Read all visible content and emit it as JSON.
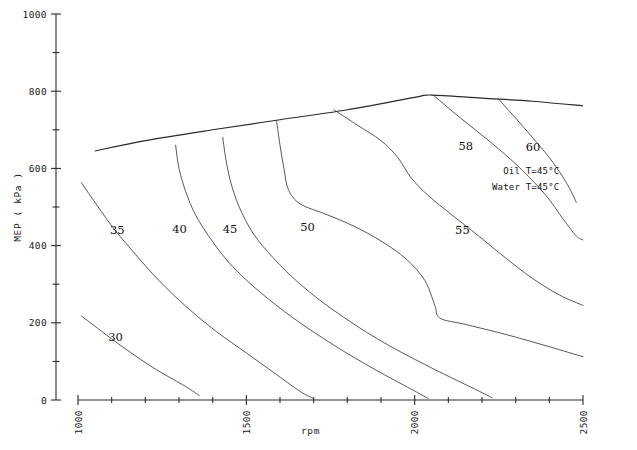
{
  "chart_data": {
    "type": "line",
    "title": "",
    "subtitle": "",
    "xlabel": "rpm",
    "ylabel": "MEP ( kPa )",
    "xlim": [
      1000,
      2500
    ],
    "ylim": [
      0,
      1000
    ],
    "grid": false,
    "legend_position": "none",
    "x_ticks": [
      "1000",
      "1500",
      "2000",
      "2500"
    ],
    "x_tick_values": [
      1000,
      1500,
      2000,
      2500
    ],
    "x_minor_step": 100,
    "y_ticks": [
      "0",
      "200",
      "400",
      "600",
      "800",
      "1000"
    ],
    "y_tick_values": [
      0,
      200,
      400,
      600,
      800,
      1000
    ],
    "y_minor_step": 100,
    "annotations": [
      {
        "name": "oil-temperature",
        "text": "Oil T=45°C",
        "x": 2430,
        "y": 585
      },
      {
        "name": "water-temperature",
        "text": "Water T=45°C",
        "x": 2430,
        "y": 545
      }
    ],
    "envelope": {
      "name": "full-load-envelope",
      "label": "",
      "points": [
        [
          1050,
          645
        ],
        [
          1200,
          672
        ],
        [
          1400,
          700
        ],
        [
          1600,
          726
        ],
        [
          1800,
          752
        ],
        [
          2000,
          784
        ],
        [
          2050,
          790
        ],
        [
          2200,
          782
        ],
        [
          2350,
          774
        ],
        [
          2500,
          762
        ]
      ]
    },
    "series": [
      {
        "name": "bsfc-30",
        "label": "30",
        "label_x": 1090,
        "label_y": 152,
        "points": [
          [
            1010,
            218
          ],
          [
            1070,
            178
          ],
          [
            1140,
            133
          ],
          [
            1230,
            80
          ],
          [
            1310,
            40
          ],
          [
            1360,
            12
          ]
        ]
      },
      {
        "name": "bsfc-35",
        "label": "35",
        "label_x": 1095,
        "label_y": 430,
        "points": [
          [
            1010,
            563
          ],
          [
            1060,
            500
          ],
          [
            1110,
            440
          ],
          [
            1170,
            378
          ],
          [
            1240,
            310
          ],
          [
            1320,
            243
          ],
          [
            1410,
            178
          ],
          [
            1500,
            122
          ],
          [
            1580,
            72
          ],
          [
            1660,
            22
          ],
          [
            1700,
            4
          ]
        ]
      },
      {
        "name": "bsfc-40",
        "label": "40",
        "label_x": 1280,
        "label_y": 432,
        "points": [
          [
            1290,
            660
          ],
          [
            1300,
            600
          ],
          [
            1320,
            540
          ],
          [
            1350,
            478
          ],
          [
            1400,
            410
          ],
          [
            1460,
            345
          ],
          [
            1540,
            280
          ],
          [
            1640,
            212
          ],
          [
            1760,
            142
          ],
          [
            1880,
            80
          ],
          [
            1990,
            28
          ],
          [
            2040,
            4
          ]
        ]
      },
      {
        "name": "bsfc-45",
        "label": "45",
        "label_x": 1430,
        "label_y": 432,
        "points": [
          [
            1430,
            680
          ],
          [
            1440,
            620
          ],
          [
            1455,
            560
          ],
          [
            1480,
            498
          ],
          [
            1520,
            432
          ],
          [
            1580,
            368
          ],
          [
            1660,
            300
          ],
          [
            1760,
            232
          ],
          [
            1890,
            158
          ],
          [
            2030,
            92
          ],
          [
            2170,
            32
          ],
          [
            2230,
            6
          ]
        ]
      },
      {
        "name": "bsfc-50",
        "label": "50",
        "label_x": 1660,
        "label_y": 437,
        "points": [
          [
            1590,
            722
          ],
          [
            1600,
            660
          ],
          [
            1612,
            598
          ],
          [
            1625,
            545
          ],
          [
            1660,
            508
          ],
          [
            1740,
            480
          ],
          [
            1820,
            450
          ],
          [
            1900,
            412
          ],
          [
            1975,
            365
          ],
          [
            2030,
            310
          ],
          [
            2060,
            245
          ],
          [
            2075,
            212
          ],
          [
            2150,
            196
          ],
          [
            2270,
            170
          ],
          [
            2400,
            138
          ],
          [
            2500,
            112
          ]
        ]
      },
      {
        "name": "bsfc-55",
        "label": "55",
        "label_x": 2120,
        "label_y": 430,
        "points": [
          [
            1760,
            752
          ],
          [
            1830,
            712
          ],
          [
            1900,
            672
          ],
          [
            1950,
            628
          ],
          [
            1990,
            575
          ],
          [
            2040,
            530
          ],
          [
            2110,
            480
          ],
          [
            2190,
            425
          ],
          [
            2270,
            368
          ],
          [
            2350,
            315
          ],
          [
            2430,
            272
          ],
          [
            2500,
            245
          ]
        ]
      },
      {
        "name": "bsfc-58",
        "label": "58",
        "label_x": 2130,
        "label_y": 648,
        "points": [
          [
            2055,
            790
          ],
          [
            2120,
            742
          ],
          [
            2180,
            700
          ],
          [
            2250,
            650
          ],
          [
            2320,
            595
          ],
          [
            2390,
            530
          ],
          [
            2440,
            470
          ],
          [
            2480,
            425
          ],
          [
            2500,
            415
          ]
        ]
      },
      {
        "name": "bsfc-60",
        "label": "60",
        "label_x": 2330,
        "label_y": 645,
        "points": [
          [
            2250,
            779
          ],
          [
            2300,
            730
          ],
          [
            2350,
            680
          ],
          [
            2400,
            628
          ],
          [
            2440,
            578
          ],
          [
            2465,
            540
          ],
          [
            2480,
            512
          ]
        ]
      }
    ]
  }
}
